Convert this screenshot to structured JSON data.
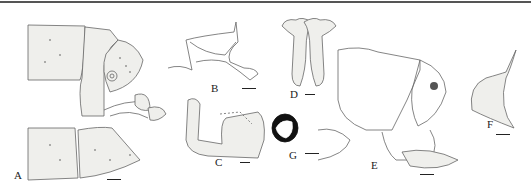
{
  "figure": {
    "panels": [
      {
        "id": "A",
        "label": "A",
        "subject": "abdomen apex, lateral view with genitalia"
      },
      {
        "id": "B",
        "label": "B",
        "subject": "genital sclerite"
      },
      {
        "id": "C",
        "label": "C",
        "subject": "aedeagus-like structure"
      },
      {
        "id": "D",
        "label": "D",
        "subject": "paired structure, dorsal view"
      },
      {
        "id": "E",
        "label": "E",
        "subject": "terminal segments, lateral view"
      },
      {
        "id": "F",
        "label": "F",
        "subject": "lobe with setae"
      },
      {
        "id": "G",
        "label": "G",
        "subject": "spermatheca"
      }
    ],
    "colors": {
      "line": "#555555",
      "fill": "#efefec",
      "dark": "#111111",
      "rule": "#555555"
    }
  }
}
